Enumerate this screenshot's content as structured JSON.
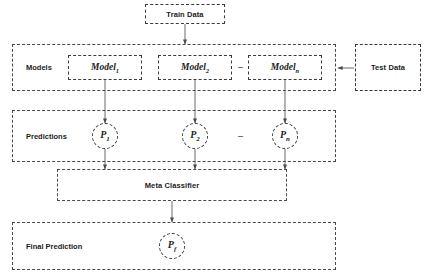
{
  "diagram": {
    "background_color": "#ffffff",
    "line_color": "#6b6b6b",
    "border_color": "#3a3a3a",
    "text_color": "#1c1c1c"
  },
  "nodes": {
    "train_data": {
      "label": "Train Data"
    },
    "test_data": {
      "label": "Test Data"
    },
    "models_row": {
      "label": "Models"
    },
    "predictions_row": {
      "label": "Predictions"
    },
    "meta_classifier": {
      "label": "Meta Classifier"
    },
    "final_prediction_row": {
      "label": "Final Prediction"
    }
  },
  "models": [
    {
      "name": "Model",
      "sub": "1"
    },
    {
      "name": "Model",
      "sub": "2"
    },
    {
      "name": "Model",
      "sub": "n"
    }
  ],
  "predictions": [
    {
      "name": "P",
      "sub": "1"
    },
    {
      "name": "P",
      "sub": "2"
    },
    {
      "name": "P",
      "sub": "n"
    }
  ],
  "final_prediction": {
    "name": "P",
    "sub": "f"
  },
  "separators": {
    "models_dash": "–",
    "predictions_dash": "–"
  }
}
